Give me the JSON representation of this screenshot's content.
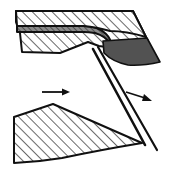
{
  "figure": {
    "width": 171,
    "height": 175,
    "background_color": "#ffffff",
    "stroke_color": "#101010",
    "hatch_color": "#2a2a2a",
    "chip_fill_color": "#525252",
    "band_fill_color": "#6e6e6e",
    "body_fill_color": "#ffffff"
  },
  "shapes": {
    "upper_body": {
      "label": "upper-hatched-workpiece",
      "fill": "#ffffff",
      "hatched": true,
      "points": "16,11 133,11 148,40 120,48 96,44 86,40 60,52 22,52 16,24"
    },
    "upper_top_slab": {
      "label": "upper-top-hatched-slab",
      "fill": "#ffffff",
      "hatched": true,
      "points": "16,11 133,11 146,37 115,30 98,27 88,26 20,26 16,22"
    },
    "dark_band": {
      "label": "dark-shear-band",
      "fill": "#6e6e6e",
      "points": "18,27 88,27 99,29 110,35 104,42 93,35 84,33 18,33"
    },
    "chip_wedge": {
      "label": "dark-chip-wedge",
      "fill": "#525252",
      "points": "104,40 146,39 160,62 131,66 113,62 101,54"
    },
    "lower_body": {
      "label": "lower-hatched-workpiece",
      "fill": "#ffffff",
      "hatched": true,
      "points": "14,116 53,105 142,143 96,152 50,163 14,163"
    },
    "shear_line": {
      "label": "shear-fracture-line",
      "from": [
        97,
        48
      ],
      "to": [
        155,
        148
      ]
    },
    "secondary_line": {
      "label": "secondary-fracture-line",
      "from": [
        94,
        50
      ],
      "to": [
        148,
        146
      ]
    }
  },
  "arrows": [
    {
      "name": "left-feed-arrow",
      "direction": "right",
      "from": [
        42,
        92
      ],
      "to": [
        67,
        92
      ],
      "color": "#101010"
    },
    {
      "name": "right-chip-flow-arrow",
      "direction": "down-right",
      "from": [
        127,
        93
      ],
      "to": [
        151,
        101
      ],
      "color": "#101010"
    }
  ]
}
